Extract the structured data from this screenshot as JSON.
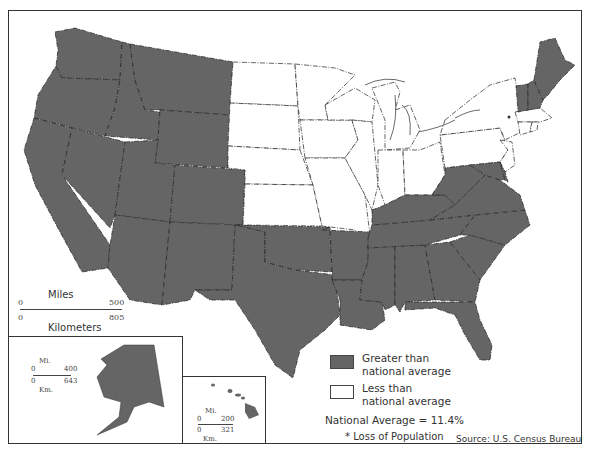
{
  "map": {
    "title": "",
    "colors": {
      "greater": "#656565",
      "less": "#ffffff",
      "border": "#222222"
    },
    "states_greater": [
      "WA",
      "OR",
      "CA",
      "ID",
      "NV",
      "MT",
      "WY",
      "UT",
      "AZ",
      "CO",
      "NM",
      "TX",
      "OK",
      "AR",
      "LA",
      "MS",
      "AL",
      "TN",
      "KY",
      "GA",
      "FL",
      "SC",
      "NC",
      "VA",
      "WV",
      "DE",
      "MD",
      "NH",
      "VT",
      "ME"
    ],
    "states_less": [
      "ND",
      "SD",
      "NE",
      "KS",
      "MN",
      "IA",
      "MO",
      "WI",
      "IL",
      "IN",
      "MI",
      "OH",
      "PA",
      "NY",
      "NJ",
      "CT",
      "RI",
      "MA"
    ],
    "loss_of_population_marker_state": "NY",
    "loss_marker": "*"
  },
  "scale_main": {
    "top_label": "Miles",
    "bottom_label": "Kilometers",
    "mi_start": "0",
    "mi_end": "500",
    "km_start": "0",
    "km_end": "805"
  },
  "inset_alaska": {
    "name": "Alaska",
    "top_label": "Mi.",
    "bottom_label": "Km.",
    "mi_start": "0",
    "mi_end": "400",
    "km_start": "0",
    "km_end": "643"
  },
  "inset_hawaii": {
    "name": "Hawaii",
    "top_label": "Mi.",
    "bottom_label": "Km.",
    "mi_start": "0",
    "mi_end": "200",
    "km_start": "0",
    "km_end": "321"
  },
  "legend": {
    "items": [
      {
        "line1": "Greater than",
        "line2": "national average",
        "color": "#656565"
      },
      {
        "line1": "Less than",
        "line2": "national average",
        "color": "#ffffff"
      }
    ],
    "national_average": "National Average = 11.4%",
    "loss_note": "* Loss of Population"
  },
  "source": "Source: U.S. Census Bureau"
}
